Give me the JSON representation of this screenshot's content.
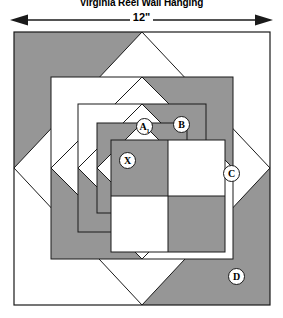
{
  "title": "Virginia Reel Wall Hanging",
  "dimension": {
    "label": "12\"",
    "arrow_icon": "double-arrow-horizontal-icon"
  },
  "colors": {
    "fabric_dark": "#969696",
    "fabric_light": "#ffffff",
    "outline": "#1a1a1a",
    "label_fill": "#ffffff"
  },
  "block": {
    "name": "virginia-reel-block",
    "size_inches": 12,
    "labels": [
      {
        "id": "A1",
        "text": "A",
        "subscript": "1",
        "x": 136,
        "y": 90
      },
      {
        "id": "B",
        "text": "B",
        "subscript": "",
        "x": 173,
        "y": 88
      },
      {
        "id": "C",
        "text": "C",
        "subscript": "",
        "x": 223,
        "y": 137
      },
      {
        "id": "D",
        "text": "D",
        "subscript": "",
        "x": 228,
        "y": 240
      },
      {
        "id": "X",
        "text": "X",
        "subscript": "",
        "x": 119,
        "y": 152
      }
    ],
    "rounds": [
      {
        "name": "outer-round",
        "order": 1,
        "piece": "D",
        "shading": "half-dark-pinwheel"
      },
      {
        "name": "second-round",
        "order": 2,
        "piece": "C",
        "shading": "half-dark-pinwheel"
      },
      {
        "name": "third-round",
        "order": 3,
        "piece": "B",
        "shading": "half-dark-pinwheel"
      },
      {
        "name": "inner-round",
        "order": 4,
        "piece": "A1",
        "shading": "half-dark-pinwheel"
      },
      {
        "name": "center-four-patch",
        "order": 5,
        "piece": "X",
        "shading": "checkerboard"
      }
    ]
  }
}
